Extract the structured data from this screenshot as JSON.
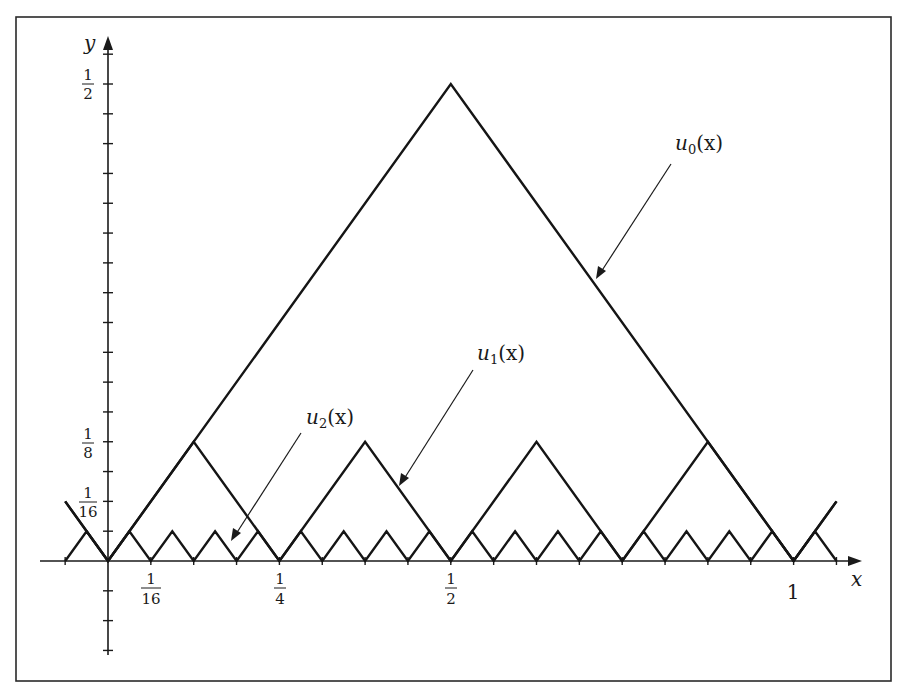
{
  "chart_data": {
    "type": "line",
    "title": "",
    "xlabel": "x",
    "ylabel": "y",
    "xlim": [
      -0.09,
      1.12
    ],
    "ylim": [
      -0.1,
      0.55
    ],
    "grid": false,
    "legend": "none (curves labeled with arrows)",
    "x_ticks": {
      "step": 0.0625,
      "labels": [
        {
          "value": 0.0625,
          "text": "1/16"
        },
        {
          "value": 0.25,
          "text": "1/4"
        },
        {
          "value": 0.5,
          "text": "1/2"
        },
        {
          "value": 1,
          "text": "1"
        }
      ]
    },
    "y_ticks": {
      "step": 0.03125,
      "labels": [
        {
          "value": 0.5,
          "text": "1/2"
        },
        {
          "value": 0.125,
          "text": "1/8"
        },
        {
          "value": 0.0625,
          "text": "1/16"
        }
      ]
    },
    "series": [
      {
        "name": "u0(x)",
        "description": "triangle wave, zeros at integers, peak 1/2 at x=1/2",
        "x": [
          -0.0625,
          0,
          0.5,
          1,
          1.0625
        ],
        "y": [
          0.0625,
          0,
          0.5,
          0,
          0.0625
        ]
      },
      {
        "name": "u1(x)",
        "description": "triangle wave, zeros at multiples of 1/4, peak 1/8",
        "x": [
          -0.0625,
          0,
          0.125,
          0.25,
          0.375,
          0.5,
          0.625,
          0.75,
          0.875,
          1,
          1.0625
        ],
        "y": [
          0.0625,
          0,
          0.125,
          0,
          0.125,
          0,
          0.125,
          0,
          0.125,
          0,
          0.0625
        ]
      },
      {
        "name": "u2(x)",
        "description": "triangle wave, zeros at multiples of 1/16, peak 1/32",
        "x": [
          -0.0625,
          -0.03125,
          0,
          0.03125,
          0.0625,
          0.09375,
          0.125,
          0.15625,
          0.1875,
          0.21875,
          0.25,
          0.28125,
          0.3125,
          0.34375,
          0.375,
          0.40625,
          0.4375,
          0.46875,
          0.5,
          0.53125,
          0.5625,
          0.59375,
          0.625,
          0.65625,
          0.6875,
          0.71875,
          0.75,
          0.78125,
          0.8125,
          0.84375,
          0.875,
          0.90625,
          0.9375,
          0.96875,
          1,
          1.03125,
          1.0625
        ],
        "y": [
          0,
          0.03125,
          0,
          0.03125,
          0,
          0.03125,
          0,
          0.03125,
          0,
          0.03125,
          0,
          0.03125,
          0,
          0.03125,
          0,
          0.03125,
          0,
          0.03125,
          0,
          0.03125,
          0,
          0.03125,
          0,
          0.03125,
          0,
          0.03125,
          0,
          0.03125,
          0,
          0.03125,
          0,
          0.03125,
          0,
          0.03125,
          0,
          0.03125,
          0
        ]
      }
    ],
    "annotations": [
      {
        "text": "u0(x)",
        "points_to": "u0 descending edge near x≈0.71"
      },
      {
        "text": "u1(x)",
        "points_to": "u1 descending edge near x≈0.43"
      },
      {
        "text": "u2(x)",
        "points_to": "u2 near x≈0.18"
      }
    ]
  },
  "labels": {
    "x_axis": "x",
    "y_axis": "y",
    "u0": {
      "base": "u",
      "sub": "0",
      "arg": "(x)"
    },
    "u1": {
      "base": "u",
      "sub": "1",
      "arg": "(x)"
    },
    "u2": {
      "base": "u",
      "sub": "2",
      "arg": "(x)"
    },
    "xtick_1_16": {
      "num": "1",
      "den": "16"
    },
    "xtick_1_4": {
      "num": "1",
      "den": "4"
    },
    "xtick_1_2": {
      "num": "1",
      "den": "2"
    },
    "xtick_1": "1",
    "ytick_1_2": {
      "num": "1",
      "den": "2"
    },
    "ytick_1_8": {
      "num": "1",
      "den": "8"
    },
    "ytick_1_16": {
      "num": "1",
      "den": "16"
    }
  }
}
